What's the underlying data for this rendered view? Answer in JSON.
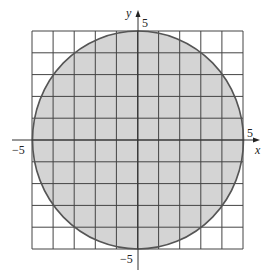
{
  "figure": {
    "type": "circle-on-grid",
    "circle": {
      "center": [
        0,
        0
      ],
      "radius": 5,
      "fill": "#d4d4d4",
      "stroke": "#555555"
    },
    "grid": {
      "xmin": -5,
      "xmax": 5,
      "ymin": -5,
      "ymax": 5,
      "step": 1,
      "color": "#444444"
    },
    "axes": {
      "x_label": "x",
      "y_label": "y",
      "x_tick_neg": "−5",
      "x_tick_pos": "5",
      "y_tick_pos": "5",
      "y_tick_neg": "−5"
    }
  }
}
